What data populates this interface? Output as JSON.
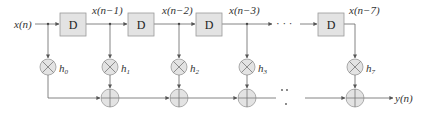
{
  "diagram": {
    "type": "FIR filter direct form (tapped delay line)",
    "input_label": "x(n)",
    "output_label": "y(n)",
    "delay_label": "D",
    "delay_outputs": [
      "x(n−1)",
      "x(n−2)",
      "x(n−3)",
      "x(n−7)"
    ],
    "coefficients": [
      {
        "base": "h",
        "sub": "0"
      },
      {
        "base": "h",
        "sub": "1"
      },
      {
        "base": "h",
        "sub": "2"
      },
      {
        "base": "h",
        "sub": "3"
      },
      {
        "base": "h",
        "sub": "7"
      }
    ],
    "ellipsis_top": "· · ·",
    "ellipsis_bottom": "· · ·",
    "colors": {
      "block_fill": "#e3e3e3",
      "block_stroke": "#888888",
      "line": "#555555"
    }
  }
}
